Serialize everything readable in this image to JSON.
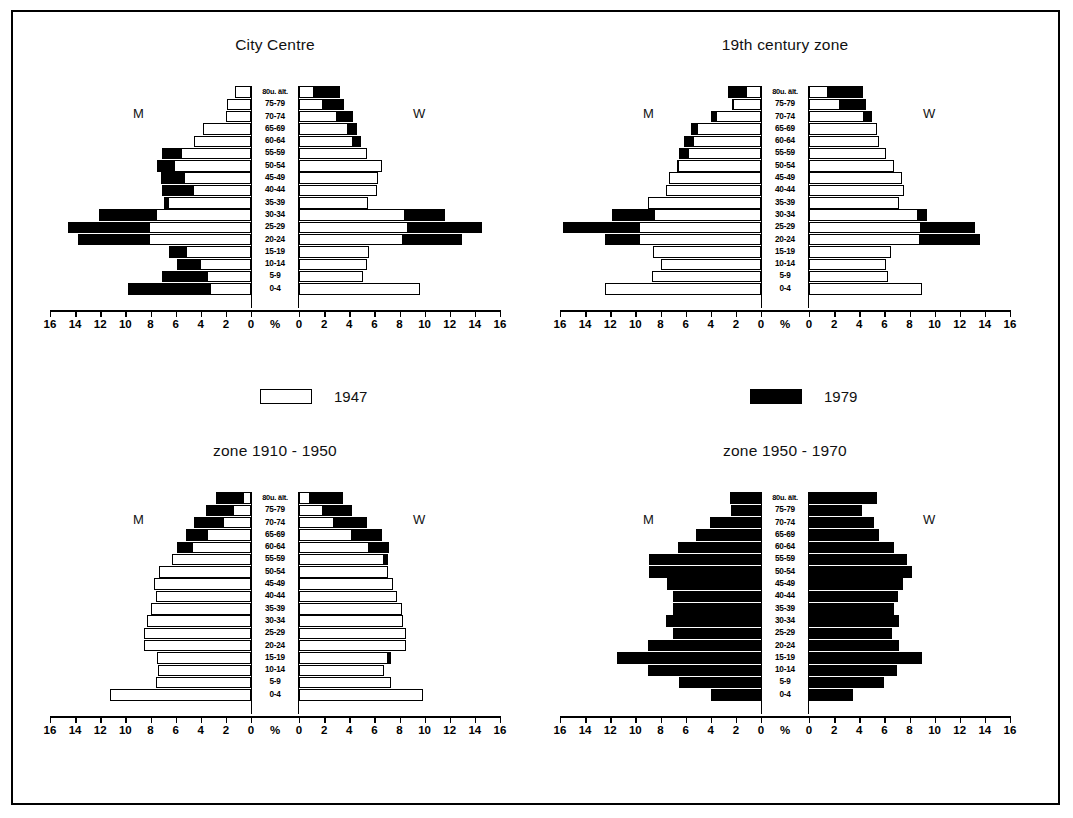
{
  "legend": {
    "items": [
      {
        "label": "1947",
        "swatch": "white",
        "color": "#ffffff"
      },
      {
        "label": "1979",
        "swatch": "black",
        "color": "#000000"
      }
    ]
  },
  "axis": {
    "unit_label": "%",
    "tick_labels": [
      "16",
      "14",
      "12",
      "10",
      "8",
      "6",
      "4",
      "2",
      "0",
      "0",
      "2",
      "4",
      "6",
      "8",
      "10",
      "12",
      "14",
      "16"
    ],
    "max": 16,
    "step": 2
  },
  "age_groups": [
    "80u. ält.",
    "75-79",
    "70-74",
    "65-69",
    "60-64",
    "55-59",
    "50-54",
    "45-49",
    "40-44",
    "35-39",
    "30-34",
    "25-29",
    "20-24",
    "15-19",
    "10-14",
    "5-9",
    "0-4"
  ],
  "side_labels": {
    "men": "M",
    "women": "W"
  },
  "panels": [
    {
      "title": "City Centre"
    },
    {
      "title": "19th century zone"
    },
    {
      "title": "zone 1910 - 1950"
    },
    {
      "title": "zone 1950 - 1970"
    }
  ],
  "chart_data": [
    {
      "type": "bar",
      "title": "City Centre",
      "subtitle": "",
      "xlabel": "%",
      "ylabel": "",
      "xlim": [
        -16,
        16
      ],
      "grid": false,
      "legend_position": "below-figure",
      "categories": [
        "80u. ält.",
        "75-79",
        "70-74",
        "65-69",
        "60-64",
        "55-59",
        "50-54",
        "45-49",
        "40-44",
        "35-39",
        "30-34",
        "25-29",
        "20-24",
        "15-19",
        "10-14",
        "5-9",
        "0-4"
      ],
      "series": [
        {
          "name": "1947",
          "side": "men",
          "values": [
            1.3,
            1.9,
            2.0,
            3.8,
            4.5,
            5.6,
            6.1,
            5.3,
            4.6,
            6.6,
            7.6,
            8.1,
            8.1,
            5.2,
            4.1,
            3.5,
            3.3
          ]
        },
        {
          "name": "1979",
          "side": "men",
          "values": [
            0.9,
            1.3,
            1.6,
            2.5,
            3.9,
            7.1,
            7.5,
            7.2,
            7.1,
            6.9,
            12.1,
            14.6,
            13.8,
            6.5,
            5.9,
            7.1,
            9.8
          ]
        },
        {
          "name": "1947",
          "side": "women",
          "values": [
            1.2,
            1.9,
            3.0,
            3.9,
            4.3,
            5.4,
            6.6,
            6.3,
            6.2,
            5.5,
            8.4,
            8.7,
            8.3,
            5.6,
            5.4,
            5.1,
            9.6
          ]
        },
        {
          "name": "1979",
          "side": "women",
          "values": [
            3.3,
            3.6,
            4.3,
            4.6,
            4.9,
            5.0,
            4.5,
            4.4,
            4.4,
            4.4,
            11.6,
            14.6,
            13.0,
            3.7,
            3.7,
            3.6,
            3.6
          ]
        }
      ]
    },
    {
      "type": "bar",
      "title": "19th century zone",
      "subtitle": "",
      "xlabel": "%",
      "ylabel": "",
      "xlim": [
        -16,
        16
      ],
      "grid": false,
      "legend_position": "below-figure",
      "categories": [
        "80u. ält.",
        "75-79",
        "70-74",
        "65-69",
        "60-64",
        "55-59",
        "50-54",
        "45-49",
        "40-44",
        "35-39",
        "30-34",
        "25-29",
        "20-24",
        "15-19",
        "10-14",
        "5-9",
        "0-4"
      ],
      "series": [
        {
          "name": "1947",
          "side": "men",
          "values": [
            1.2,
            2.2,
            3.6,
            5.1,
            5.4,
            5.8,
            6.6,
            7.3,
            7.6,
            9.0,
            8.5,
            9.7,
            9.7,
            8.6,
            8.0,
            8.7,
            12.4
          ]
        },
        {
          "name": "1979",
          "side": "men",
          "values": [
            2.6,
            2.3,
            4.0,
            5.6,
            6.1,
            6.5,
            6.7,
            6.9,
            7.0,
            6.8,
            11.9,
            15.8,
            12.4,
            6.1,
            6.1,
            6.3,
            6.5
          ]
        },
        {
          "name": "1947",
          "side": "women",
          "values": [
            1.5,
            2.5,
            4.4,
            5.4,
            5.6,
            6.1,
            6.8,
            7.4,
            7.6,
            7.2,
            8.7,
            8.9,
            8.8,
            6.5,
            6.1,
            6.3,
            9.0
          ]
        },
        {
          "name": "1979",
          "side": "women",
          "values": [
            4.3,
            4.5,
            5.0,
            5.2,
            5.6,
            5.7,
            5.2,
            5.1,
            4.9,
            4.7,
            9.4,
            13.2,
            13.6,
            4.4,
            4.4,
            4.4,
            4.4
          ]
        }
      ]
    },
    {
      "type": "bar",
      "title": "zone 1910 - 1950",
      "subtitle": "",
      "xlabel": "%",
      "ylabel": "",
      "xlim": [
        -16,
        16
      ],
      "grid": false,
      "legend_position": "below-figure",
      "categories": [
        "80u. ält.",
        "75-79",
        "70-74",
        "65-69",
        "60-64",
        "55-59",
        "50-54",
        "45-49",
        "40-44",
        "35-39",
        "30-34",
        "25-29",
        "20-24",
        "15-19",
        "10-14",
        "5-9",
        "0-4"
      ],
      "series": [
        {
          "name": "1947",
          "side": "men",
          "values": [
            0.6,
            1.4,
            2.2,
            3.5,
            4.7,
            6.3,
            7.3,
            7.7,
            7.6,
            8.0,
            8.3,
            8.5,
            8.5,
            7.5,
            7.4,
            7.6,
            11.2
          ]
        },
        {
          "name": "1979",
          "side": "men",
          "values": [
            2.8,
            3.6,
            4.5,
            5.2,
            5.9,
            6.3,
            6.6,
            6.8,
            6.8,
            6.8,
            7.1,
            7.5,
            7.9,
            7.5,
            7.2,
            6.6,
            5.5
          ]
        },
        {
          "name": "1947",
          "side": "women",
          "values": [
            0.9,
            1.9,
            2.8,
            4.2,
            5.6,
            6.8,
            7.1,
            7.5,
            7.8,
            8.2,
            8.3,
            8.5,
            8.5,
            7.1,
            6.8,
            7.3,
            9.9
          ]
        },
        {
          "name": "1979",
          "side": "women",
          "values": [
            3.5,
            4.2,
            5.4,
            6.6,
            7.2,
            7.1,
            6.4,
            6.4,
            6.4,
            6.6,
            6.9,
            7.2,
            8.4,
            7.3,
            6.4,
            5.6,
            4.6
          ]
        }
      ]
    },
    {
      "type": "bar",
      "title": "zone 1950 - 1970",
      "subtitle": "",
      "xlabel": "%",
      "ylabel": "",
      "xlim": [
        -16,
        16
      ],
      "grid": false,
      "legend_position": "below-figure",
      "categories": [
        "80u. ält.",
        "75-79",
        "70-74",
        "65-69",
        "60-64",
        "55-59",
        "50-54",
        "45-49",
        "40-44",
        "35-39",
        "30-34",
        "25-29",
        "20-24",
        "15-19",
        "10-14",
        "5-9",
        "0-4"
      ],
      "series": [
        {
          "name": "1947",
          "side": "men",
          "values": [
            0,
            0,
            0,
            0,
            0,
            0,
            0,
            0,
            0,
            0,
            0,
            0,
            0,
            0,
            0,
            0,
            0
          ]
        },
        {
          "name": "1979",
          "side": "men",
          "values": [
            2.5,
            2.4,
            4.1,
            5.2,
            6.6,
            8.9,
            8.9,
            7.5,
            7.0,
            7.0,
            7.6,
            7.0,
            9.0,
            11.5,
            9.0,
            6.5,
            4.0
          ]
        },
        {
          "name": "1947",
          "side": "women",
          "values": [
            0,
            0,
            0,
            0,
            0,
            0,
            0,
            0,
            0,
            0,
            0,
            0,
            0,
            0,
            0,
            0,
            0
          ]
        },
        {
          "name": "1979",
          "side": "women",
          "values": [
            5.4,
            4.2,
            5.2,
            5.6,
            6.8,
            7.8,
            8.2,
            7.5,
            7.1,
            6.8,
            7.2,
            6.6,
            7.2,
            9.0,
            7.0,
            6.0,
            3.5
          ]
        }
      ]
    }
  ]
}
